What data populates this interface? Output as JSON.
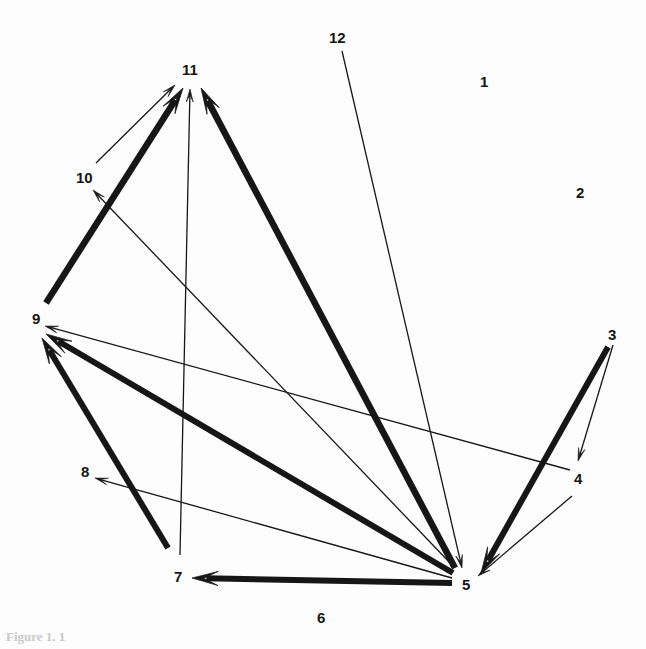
{
  "figure": {
    "caption": "Figure 1. 1",
    "background_color": "#fdfdfd",
    "stroke_color": "#161616",
    "width": 646,
    "height": 649
  },
  "nodes": [
    {
      "id": "1",
      "label": "1",
      "x": 484,
      "y": 82,
      "label_x": 480,
      "label_y": 74,
      "isolated": true
    },
    {
      "id": "2",
      "label": "2",
      "x": 580,
      "y": 193,
      "label_x": 576,
      "label_y": 185,
      "isolated": true
    },
    {
      "id": "3",
      "label": "3",
      "x": 612,
      "y": 335,
      "label_x": 608,
      "label_y": 327,
      "isolated": false
    },
    {
      "id": "4",
      "label": "4",
      "x": 578,
      "y": 479,
      "label_x": 574,
      "label_y": 471,
      "isolated": false
    },
    {
      "id": "5",
      "label": "5",
      "x": 466,
      "y": 585,
      "label_x": 462,
      "label_y": 577,
      "isolated": false
    },
    {
      "id": "6",
      "label": "6",
      "x": 321,
      "y": 618,
      "label_x": 317,
      "label_y": 610,
      "isolated": true
    },
    {
      "id": "7",
      "label": "7",
      "x": 178,
      "y": 577,
      "label_x": 174,
      "label_y": 569,
      "isolated": false
    },
    {
      "id": "8",
      "label": "8",
      "x": 85,
      "y": 472,
      "label_x": 81,
      "label_y": 464,
      "isolated": false
    },
    {
      "id": "9",
      "label": "9",
      "x": 36,
      "y": 319,
      "label_x": 32,
      "label_y": 311,
      "isolated": false
    },
    {
      "id": "10",
      "label": "10",
      "x": 85,
      "y": 178,
      "label_x": 76,
      "label_y": 170,
      "isolated": false
    },
    {
      "id": "11",
      "label": "11",
      "x": 191,
      "y": 70,
      "label_x": 182,
      "label_y": 62,
      "isolated": false
    },
    {
      "id": "12",
      "label": "12",
      "x": 338,
      "y": 38,
      "label_x": 329,
      "label_y": 30,
      "isolated": true
    }
  ],
  "edges": [
    {
      "id": "e-9-11",
      "from": "9",
      "to": "11",
      "weight": "thick",
      "width": 6.5,
      "x1": 46,
      "y1": 303,
      "x2": 183,
      "y2": 88,
      "head": "large"
    },
    {
      "id": "e-10-11",
      "from": "10",
      "to": "11",
      "weight": "thin",
      "width": 1.3,
      "x1": 96,
      "y1": 163,
      "x2": 175,
      "y2": 85,
      "head": "small"
    },
    {
      "id": "e-7-11",
      "from": "7",
      "to": "11",
      "weight": "thin",
      "width": 1.3,
      "x1": 180,
      "y1": 555,
      "x2": 190,
      "y2": 89,
      "head": "small"
    },
    {
      "id": "e-5-11",
      "from": "5",
      "to": "11",
      "weight": "thick",
      "width": 6.5,
      "x1": 455,
      "y1": 568,
      "x2": 201,
      "y2": 88,
      "head": "large"
    },
    {
      "id": "e-5-10",
      "from": "5",
      "to": "10",
      "weight": "thin",
      "width": 1.3,
      "x1": 452,
      "y1": 565,
      "x2": 93,
      "y2": 190,
      "head": "small"
    },
    {
      "id": "e-5-9",
      "from": "5",
      "to": "9",
      "weight": "thick",
      "width": 6.0,
      "x1": 453,
      "y1": 573,
      "x2": 46,
      "y2": 334,
      "head": "large"
    },
    {
      "id": "e-5-8",
      "from": "5",
      "to": "8",
      "weight": "thin",
      "width": 1.3,
      "x1": 452,
      "y1": 578,
      "x2": 95,
      "y2": 478,
      "head": "small"
    },
    {
      "id": "e-5-7",
      "from": "5",
      "to": "7",
      "weight": "thick",
      "width": 6.0,
      "x1": 452,
      "y1": 583,
      "x2": 192,
      "y2": 578,
      "head": "large"
    },
    {
      "id": "e-7-9",
      "from": "7",
      "to": "9",
      "weight": "thick",
      "width": 6.0,
      "x1": 168,
      "y1": 548,
      "x2": 42,
      "y2": 338,
      "head": "large"
    },
    {
      "id": "e-4-9",
      "from": "4",
      "to": "9",
      "weight": "thin",
      "width": 1.3,
      "x1": 570,
      "y1": 470,
      "x2": 45,
      "y2": 326,
      "head": "small"
    },
    {
      "id": "e-3-5",
      "from": "3",
      "to": "5",
      "weight": "thick",
      "width": 6.0,
      "x1": 608,
      "y1": 347,
      "x2": 481,
      "y2": 573,
      "head": "large"
    },
    {
      "id": "e-3-4",
      "from": "3",
      "to": "4",
      "weight": "thin",
      "width": 1.3,
      "x1": 613,
      "y1": 345,
      "x2": 578,
      "y2": 461,
      "head": "small"
    },
    {
      "id": "e-4-5",
      "from": "4",
      "to": "5",
      "weight": "thin",
      "width": 1.3,
      "x1": 572,
      "y1": 496,
      "x2": 478,
      "y2": 576,
      "head": "small"
    },
    {
      "id": "e-12-5",
      "from": "12",
      "to": "5",
      "weight": "thin",
      "width": 1.3,
      "x1": 342,
      "y1": 51,
      "x2": 462,
      "y2": 568,
      "head": "small"
    }
  ],
  "legend": {
    "thick_meaning": "thick edge",
    "thin_meaning": "thin edge"
  }
}
